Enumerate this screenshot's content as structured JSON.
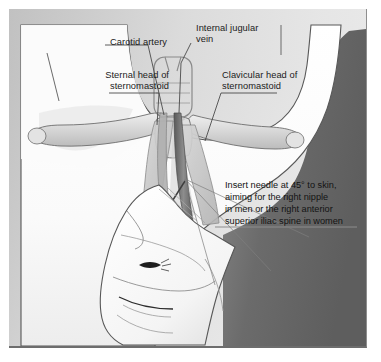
{
  "figure": {
    "labels": [
      {
        "id": "carotid-artery",
        "text": "Carotid artery"
      },
      {
        "id": "internal-jugular-vein",
        "text": "Internal jugular\nvein"
      },
      {
        "id": "sternal-head",
        "text": "Sternal head of\nsternomastoid"
      },
      {
        "id": "clavicular-head",
        "text": "Clavicular head of\nsternomastoid"
      }
    ],
    "instruction": "Insert needle at 45° to skin,\naiming for the right nipple\nin men or the right anterior\nsuperior iliac spine in women",
    "colors": {
      "plate_background": "#d4d4d4",
      "skin_fill": "#fcfcfc",
      "shadow_band": "#6f6f6f",
      "muscle_fill": "#c8c8c8",
      "bone_fill": "#dcdcdc",
      "vein_fill": "#8f8f8f",
      "artery_fill": "#a8a8a8",
      "syringe_fill": "#bdbdbd",
      "label_text": "#1b1b1b",
      "leader_line": "#4a4a4a",
      "plate_border": "#6d6d6d"
    }
  }
}
